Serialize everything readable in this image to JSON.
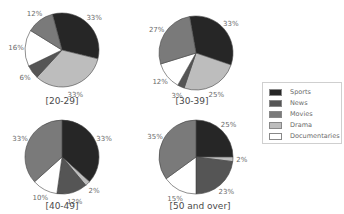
{
  "chart_data": [
    {
      "type": "pie",
      "title": "[20-29]",
      "labels": [
        "Sports",
        "Drama",
        "News",
        "Documentaries",
        "Movies"
      ],
      "values": [
        33,
        33,
        6,
        16,
        12
      ],
      "unit": "%"
    },
    {
      "type": "pie",
      "title": "[30-39]",
      "labels": [
        "Sports",
        "Drama",
        "News",
        "Documentaries",
        "Movies"
      ],
      "values": [
        33,
        25,
        3,
        12,
        27
      ],
      "unit": "%"
    },
    {
      "type": "pie",
      "title": "[40-49]",
      "labels": [
        "Sports",
        "Drama",
        "News",
        "Documentaries",
        "Movies"
      ],
      "values": [
        33,
        2,
        12,
        10,
        33
      ],
      "unit": "%"
    },
    {
      "type": "pie",
      "title": "[50 and over]",
      "labels": [
        "Sports",
        "Drama",
        "News",
        "Documentaries",
        "Movies"
      ],
      "values": [
        25,
        2,
        23,
        15,
        35
      ],
      "unit": "%"
    }
  ],
  "legend": {
    "position": "right",
    "items": [
      {
        "label": "Sports",
        "color": "#262626"
      },
      {
        "label": "News",
        "color": "#555555"
      },
      {
        "label": "Movies",
        "color": "#7a7a7a"
      },
      {
        "label": "Drama",
        "color": "#bdbdbd"
      },
      {
        "label": "Documentaries",
        "color": "#ffffff"
      }
    ]
  }
}
